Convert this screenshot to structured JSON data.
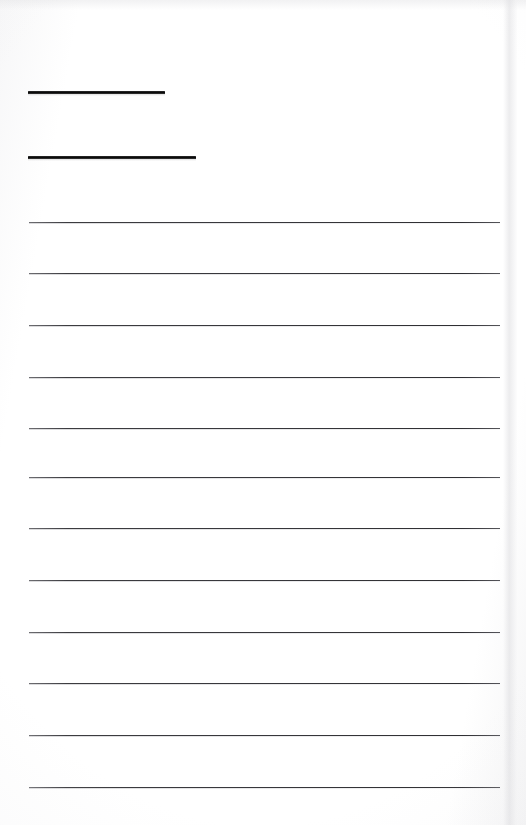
{
  "document": {
    "kind": "ruled-writing-page",
    "title": "",
    "background_color": "#fdfdfd",
    "ink_color": "#0b0b0b",
    "rule_color": "#37373b",
    "page_width": 526,
    "page_height": 825
  },
  "header_rules": [
    {
      "label": "",
      "x": 28,
      "y": 91,
      "width": 137,
      "thickness": 3
    },
    {
      "label": "",
      "x": 28,
      "y": 156,
      "width": 168,
      "thickness": 3
    }
  ],
  "writing_rules": [
    {
      "index": 1,
      "label": "",
      "x": 29,
      "y": 222,
      "width": 471,
      "thickness": 1
    },
    {
      "index": 2,
      "label": "",
      "x": 29,
      "y": 273,
      "width": 471,
      "thickness": 1
    },
    {
      "index": 3,
      "label": "",
      "x": 29,
      "y": 325,
      "width": 471,
      "thickness": 1
    },
    {
      "index": 4,
      "label": "",
      "x": 29,
      "y": 377,
      "width": 471,
      "thickness": 1
    },
    {
      "index": 5,
      "label": "",
      "x": 29,
      "y": 428,
      "width": 471,
      "thickness": 1
    },
    {
      "index": 6,
      "label": "",
      "x": 29,
      "y": 477,
      "width": 471,
      "thickness": 1
    },
    {
      "index": 7,
      "label": "",
      "x": 29,
      "y": 528,
      "width": 471,
      "thickness": 1
    },
    {
      "index": 8,
      "label": "",
      "x": 29,
      "y": 580,
      "width": 471,
      "thickness": 1
    },
    {
      "index": 9,
      "label": "",
      "x": 29,
      "y": 632,
      "width": 471,
      "thickness": 1
    },
    {
      "index": 10,
      "label": "",
      "x": 29,
      "y": 683,
      "width": 471,
      "thickness": 1
    },
    {
      "index": 11,
      "label": "",
      "x": 29,
      "y": 735,
      "width": 471,
      "thickness": 1
    },
    {
      "index": 12,
      "label": "",
      "x": 29,
      "y": 787,
      "width": 471,
      "thickness": 1
    }
  ]
}
